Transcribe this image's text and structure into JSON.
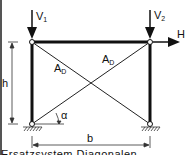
{
  "diagram": {
    "type": "braced frame (portal frame with cross diagonals)",
    "loads": {
      "v1": {
        "label": "V",
        "sub": "1"
      },
      "v2": {
        "label": "V",
        "sub": "2"
      },
      "h": {
        "label": "H"
      }
    },
    "diagonals": [
      {
        "label": "A",
        "sub": "D"
      },
      {
        "label": "A",
        "sub": "D"
      }
    ],
    "dimensions": {
      "height": "h",
      "width": "b"
    },
    "angle": "α",
    "caption": "Ersatzsystem Diagonalen"
  },
  "colors": {
    "line": "#111111",
    "background": "#ffffff",
    "border": "#555555"
  }
}
